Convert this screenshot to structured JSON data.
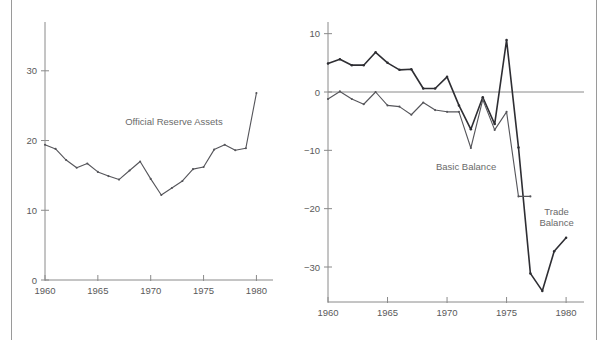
{
  "figure": {
    "background_color": "#ffffff",
    "frame_color": "#9a9a9a",
    "axis_color": "#8a8a8a",
    "label_color": "#5a5a5a"
  },
  "chart_data": [
    {
      "type": "line",
      "panel": "left",
      "title": "",
      "xlabel": "",
      "ylabel": "",
      "xlim": [
        1960,
        1981
      ],
      "ylim": [
        0,
        37
      ],
      "grid": false,
      "legend_position": "inline-annotation",
      "xticks": [
        1960,
        1965,
        1970,
        1975,
        1980
      ],
      "xticklabels": [
        "1960",
        "1965",
        "1970",
        "1975",
        "1980"
      ],
      "yticks": [
        0,
        10,
        20,
        30
      ],
      "yticklabels": [
        "0",
        "10",
        "20",
        "30"
      ],
      "annotations": [
        {
          "text": "Official Reserve Assets",
          "x": 1972.2,
          "y": 22.3
        }
      ],
      "series": [
        {
          "name": "Official Reserve Assets",
          "color": "#55555a",
          "width": "thin",
          "x": [
            1960,
            1961,
            1962,
            1963,
            1964,
            1965,
            1966,
            1967,
            1968,
            1969,
            1970,
            1971,
            1972,
            1973,
            1974,
            1975,
            1976,
            1977,
            1978,
            1979,
            1980
          ],
          "values": [
            19.4,
            18.8,
            17.2,
            16.1,
            16.7,
            15.5,
            14.9,
            14.4,
            15.7,
            17.0,
            14.5,
            12.2,
            13.2,
            14.2,
            15.9,
            16.2,
            18.7,
            19.4,
            18.6,
            18.9,
            26.8
          ]
        }
      ]
    },
    {
      "type": "line",
      "panel": "right",
      "title": "",
      "xlabel": "",
      "ylabel": "",
      "xlim": [
        1960,
        1981
      ],
      "ylim": [
        -36,
        12
      ],
      "grid": false,
      "zero_line": true,
      "legend_position": "inline-annotation",
      "xticks": [
        1960,
        1965,
        1970,
        1975,
        1980
      ],
      "xticklabels": [
        "1960",
        "1965",
        "1970",
        "1975",
        "1980"
      ],
      "yticks": [
        10,
        0,
        -10,
        -20,
        -30
      ],
      "yticklabels": [
        "10",
        "0",
        "−10",
        "−20",
        "−30"
      ],
      "annotations": [
        {
          "text": "Basic Balance",
          "x": 1971.6,
          "y": -13.3
        },
        {
          "text": "Trade",
          "x": 1979.2,
          "y": -21.0
        },
        {
          "text": "Balance",
          "x": 1979.2,
          "y": -23.0
        }
      ],
      "series": [
        {
          "name": "Trade Balance",
          "color": "#2e2e33",
          "width": "thick",
          "x": [
            1960,
            1961,
            1962,
            1963,
            1964,
            1965,
            1966,
            1967,
            1968,
            1969,
            1970,
            1971,
            1972,
            1973,
            1974,
            1975,
            1976,
            1977,
            1978,
            1979,
            1980
          ],
          "values": [
            4.9,
            5.6,
            4.6,
            4.6,
            6.8,
            5.0,
            3.8,
            3.9,
            0.6,
            0.6,
            2.6,
            -2.3,
            -6.4,
            -0.9,
            -5.5,
            8.9,
            -9.5,
            -31.1,
            -34.1,
            -27.3,
            -25.0
          ]
        },
        {
          "name": "Basic Balance",
          "color": "#55555a",
          "width": "thin",
          "x": [
            1960,
            1961,
            1962,
            1963,
            1964,
            1965,
            1966,
            1967,
            1968,
            1969,
            1970,
            1971,
            1972,
            1973,
            1974,
            1975,
            1976,
            1977
          ],
          "values": [
            -1.2,
            0.1,
            -1.2,
            -2.1,
            0.0,
            -2.3,
            -2.5,
            -3.9,
            -1.8,
            -3.1,
            -3.4,
            -3.4,
            -9.6,
            -1.3,
            -6.5,
            -3.4,
            -17.9,
            -17.9
          ]
        }
      ]
    }
  ]
}
